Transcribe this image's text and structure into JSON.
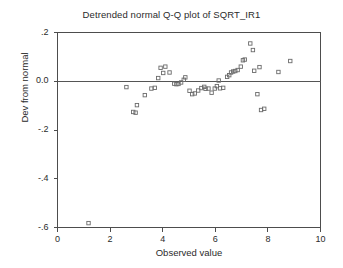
{
  "chart_data": {
    "type": "scatter",
    "title": "Detrended normal Q-Q plot of SQRT_IR1",
    "xlabel": "Observed value",
    "ylabel": "Dev from normal",
    "xlim": [
      0,
      10
    ],
    "ylim": [
      -0.6,
      0.2
    ],
    "xticks": [
      0,
      2,
      4,
      6,
      8,
      10
    ],
    "xticklabels": [
      "0",
      "2",
      "4",
      "6",
      "8",
      "10"
    ],
    "yticks": [
      0.2,
      0.0,
      -0.2,
      -0.4,
      -0.6
    ],
    "yticklabels": [
      ".2",
      "0.0",
      "-.2",
      "-.4",
      "-.6"
    ],
    "grid": false,
    "legend": null,
    "reference_line": {
      "y": 0.0,
      "orientation": "horizontal"
    },
    "marker": {
      "shape": "open-square",
      "size": 3.4,
      "color": "#6b6b6b"
    },
    "points": [
      {
        "x": 1.18,
        "y": -0.582
      },
      {
        "x": 2.62,
        "y": -0.024
      },
      {
        "x": 2.88,
        "y": -0.126
      },
      {
        "x": 2.97,
        "y": -0.129
      },
      {
        "x": 3.02,
        "y": -0.098
      },
      {
        "x": 3.32,
        "y": -0.057
      },
      {
        "x": 3.57,
        "y": -0.03
      },
      {
        "x": 3.7,
        "y": -0.027
      },
      {
        "x": 3.83,
        "y": 0.013
      },
      {
        "x": 3.92,
        "y": 0.055
      },
      {
        "x": 4.02,
        "y": 0.034
      },
      {
        "x": 4.1,
        "y": 0.06
      },
      {
        "x": 4.26,
        "y": 0.036
      },
      {
        "x": 4.44,
        "y": -0.01
      },
      {
        "x": 4.52,
        "y": -0.012
      },
      {
        "x": 4.6,
        "y": -0.011
      },
      {
        "x": 4.7,
        "y": -0.005
      },
      {
        "x": 4.8,
        "y": 0.006
      },
      {
        "x": 4.86,
        "y": 0.016
      },
      {
        "x": 5.02,
        "y": -0.039
      },
      {
        "x": 5.12,
        "y": -0.053
      },
      {
        "x": 5.22,
        "y": -0.05
      },
      {
        "x": 5.35,
        "y": -0.038
      },
      {
        "x": 5.47,
        "y": -0.028
      },
      {
        "x": 5.58,
        "y": -0.023
      },
      {
        "x": 5.63,
        "y": -0.031
      },
      {
        "x": 5.74,
        "y": -0.03
      },
      {
        "x": 5.86,
        "y": -0.047
      },
      {
        "x": 5.98,
        "y": -0.03
      },
      {
        "x": 6.06,
        "y": -0.02
      },
      {
        "x": 6.13,
        "y": 0.003
      },
      {
        "x": 6.18,
        "y": -0.029
      },
      {
        "x": 6.3,
        "y": -0.027
      },
      {
        "x": 6.45,
        "y": 0.018
      },
      {
        "x": 6.53,
        "y": 0.025
      },
      {
        "x": 6.6,
        "y": 0.036
      },
      {
        "x": 6.68,
        "y": 0.04
      },
      {
        "x": 6.76,
        "y": 0.042
      },
      {
        "x": 6.85,
        "y": 0.046
      },
      {
        "x": 6.97,
        "y": 0.06
      },
      {
        "x": 7.05,
        "y": 0.086
      },
      {
        "x": 7.12,
        "y": 0.089
      },
      {
        "x": 7.33,
        "y": 0.155
      },
      {
        "x": 7.43,
        "y": 0.128
      },
      {
        "x": 7.48,
        "y": 0.043
      },
      {
        "x": 7.6,
        "y": -0.053
      },
      {
        "x": 7.68,
        "y": 0.058
      },
      {
        "x": 7.74,
        "y": -0.118
      },
      {
        "x": 7.86,
        "y": -0.113
      },
      {
        "x": 8.4,
        "y": 0.038
      },
      {
        "x": 8.85,
        "y": 0.083
      }
    ]
  },
  "colors": {
    "axis": "#4d4d4d",
    "marker": "#6b6b6b",
    "reference_line": "#555555",
    "text": "#2b2b2b",
    "background": "#ffffff"
  }
}
